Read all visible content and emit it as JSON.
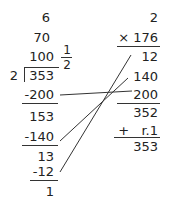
{
  "division": {
    "partial_quotients": [
      "6",
      "70",
      "100"
    ],
    "remainder_fraction": {
      "numerator": "1",
      "denominator": "2"
    },
    "divisor": "2",
    "dividend": "353",
    "steps": [
      "-200",
      "153",
      "-140",
      "13",
      "-12",
      "1"
    ]
  },
  "multiplication": {
    "top": "2",
    "multiplier": "× 176",
    "partial_products": [
      "12",
      "140",
      "200"
    ],
    "sum": "352",
    "remainder_add": "+   r.1",
    "result": "353"
  },
  "connectors": [
    {
      "from": "-200",
      "to": "200"
    },
    {
      "from": "-140",
      "to": "140"
    },
    {
      "from": "-12",
      "to": "12"
    }
  ]
}
